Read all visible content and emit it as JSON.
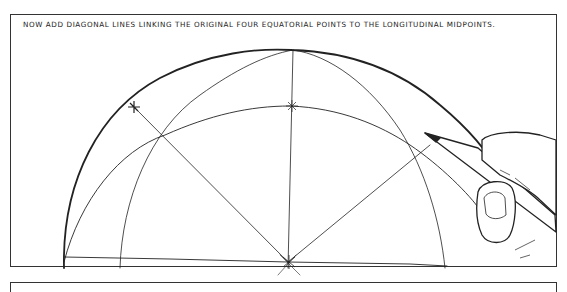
{
  "panel": {
    "caption": "NOW ADD DIAGONAL LINES LINKING THE ORIGINAL FOUR EQUATORIAL POINTS TO THE LONGITUDINAL MIDPOINTS."
  },
  "illustration": {
    "subject": "hemisphere construction drawing with longitude arcs, equatorial points and diagonal lines",
    "elements": [
      "outer-dome-outline",
      "longitude-arcs",
      "latitude-arc",
      "equator-line",
      "diagonal-lines",
      "cross-marks",
      "hand-holding-pencil"
    ],
    "stroke_color": "#222222"
  }
}
